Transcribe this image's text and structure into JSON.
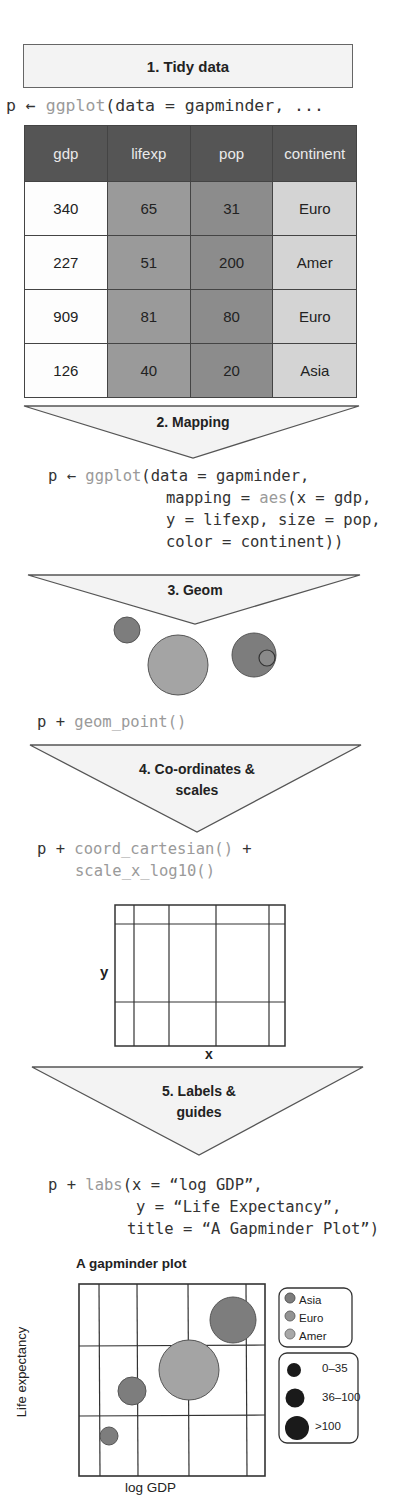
{
  "steps": {
    "s1": {
      "label": "1. Tidy data"
    },
    "s2": {
      "label": "2. Mapping"
    },
    "s3": {
      "label": "3. Geom"
    },
    "s4": {
      "line1": "4. Co-ordinates &",
      "line2": "scales"
    },
    "s5": {
      "line1": "5. Labels &",
      "line2": "guides"
    }
  },
  "code": {
    "c1": {
      "prefix": "p ← ",
      "fn": "ggplot",
      "rest": "(data = gapminder, ..."
    },
    "c2": {
      "l1_prefix": "p ← ",
      "l1_fn": "ggplot",
      "l1_rest": "(data = gapminder,",
      "l2_pre": "mapping = ",
      "l2_fn": "aes",
      "l2_rest": "(x = gdp,",
      "l3": "y = lifexp, size = pop,",
      "l4": "color = continent))"
    },
    "c3": {
      "prefix": "p + ",
      "fn": "geom_point()"
    },
    "c4": {
      "prefix": "p + ",
      "fn1": "coord_cartesian()",
      "plus": " +",
      "fn2": "scale_x_log10()"
    },
    "c5": {
      "l1_prefix": "p + ",
      "l1_fn": "labs",
      "l1_rest": "(x = “log GDP”,",
      "l2": "y = “Life Expectancy”,",
      "l3": "title = “A Gapminder Plot”)"
    }
  },
  "table": {
    "headers": [
      "gdp",
      "lifexp",
      "pop",
      "continent"
    ],
    "rows": [
      [
        "340",
        "65",
        "31",
        "Euro"
      ],
      [
        "227",
        "51",
        "200",
        "Amer"
      ],
      [
        "909",
        "81",
        "80",
        "Euro"
      ],
      [
        "126",
        "40",
        "20",
        "Asia"
      ]
    ]
  },
  "coord_plot": {
    "xlabel": "x",
    "ylabel": "y"
  },
  "final_plot": {
    "title": "A gapminder plot",
    "xlabel": "log GDP",
    "ylabel": "Life expectancy",
    "legend_color": {
      "items": [
        "Asia",
        "Euro",
        "Amer"
      ]
    },
    "legend_size": {
      "items": [
        "0–35",
        "36–100",
        ">100"
      ]
    }
  },
  "colors": {
    "header_bg": "#555555",
    "triangle_fill": "#f3f3f3",
    "point_dark": "#7d7d7d",
    "point_mid": "#9a9a9a",
    "point_light": "#a8a8a8",
    "size_legend": "#1a1a1a"
  }
}
